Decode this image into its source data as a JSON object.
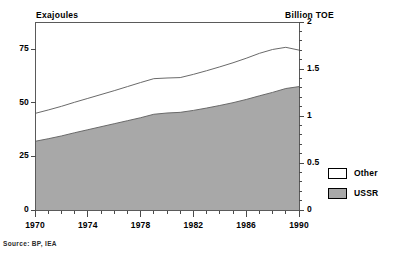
{
  "titles": {
    "left_axis_title": "Exajoules",
    "right_axis_title": "Billion TOE"
  },
  "source_note": "Source: BP, IEA",
  "legend": {
    "items": [
      {
        "label": "Other",
        "color": "#ffffff",
        "swatch_name": "legend-swatch-other"
      },
      {
        "label": "USSR",
        "color": "#a8a8a8",
        "swatch_name": "legend-swatch-ussr"
      }
    ]
  },
  "axes": {
    "left": {
      "ticks": [
        "0",
        "25",
        "50",
        "75"
      ],
      "values": [
        0,
        25,
        50,
        75
      ],
      "min": 0,
      "max": 87.6
    },
    "right": {
      "ticks": [
        "0",
        "0.5",
        "1",
        "1.5",
        "2"
      ],
      "values": [
        0,
        0.5,
        1,
        1.5,
        2
      ],
      "min": 0,
      "max": 2
    },
    "bottom": {
      "ticks": [
        "1970",
        "1974",
        "1978",
        "1982",
        "1986",
        "1990"
      ],
      "values": [
        1970,
        1974,
        1978,
        1982,
        1986,
        1990
      ],
      "min": 1970,
      "max": 1990,
      "minor_step": 1
    }
  },
  "chart_data": {
    "type": "area",
    "stacked": true,
    "title": "",
    "subtitle": "",
    "xlabel": "",
    "ylabel": "Exajoules",
    "y2label": "Billion TOE",
    "xlim": [
      1970,
      1990
    ],
    "ylim": [
      0,
      87.6
    ],
    "y2lim": [
      0,
      2
    ],
    "grid": false,
    "legend_position": "right",
    "annotations": [
      "Source: BP, IEA"
    ],
    "x": [
      1970,
      1971,
      1972,
      1973,
      1974,
      1975,
      1976,
      1977,
      1978,
      1979,
      1980,
      1981,
      1982,
      1983,
      1984,
      1985,
      1986,
      1987,
      1988,
      1989,
      1990
    ],
    "series": [
      {
        "name": "USSR",
        "color": "#a8a8a8",
        "values": [
          32.0,
          33.2,
          34.5,
          36.0,
          37.4,
          38.8,
          40.2,
          41.6,
          43.0,
          44.6,
          45.2,
          45.5,
          46.4,
          47.5,
          48.7,
          50.0,
          51.5,
          53.2,
          54.8,
          56.6,
          57.5
        ]
      },
      {
        "name": "Other",
        "color": "#ffffff",
        "values": [
          13.0,
          13.4,
          13.8,
          14.2,
          14.6,
          15.0,
          15.4,
          15.9,
          16.4,
          16.6,
          16.3,
          16.2,
          16.8,
          17.4,
          18.0,
          18.6,
          19.2,
          19.8,
          20.0,
          19.2,
          17.0
        ]
      }
    ],
    "totals": [
      45.0,
      46.6,
      48.3,
      50.2,
      52.0,
      53.8,
      55.6,
      57.5,
      59.4,
      61.2,
      61.5,
      61.7,
      63.2,
      64.9,
      66.7,
      68.6,
      70.7,
      73.0,
      74.8,
      75.8,
      74.5
    ]
  }
}
